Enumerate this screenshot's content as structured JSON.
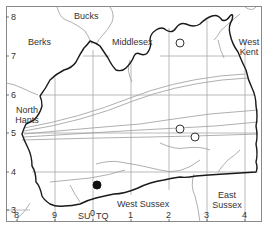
{
  "map": {
    "title": "",
    "colors": {
      "background": "#ffffff",
      "frame": "#8a8a8a",
      "grid": "#a8a8a8",
      "boundary": "#1a1a1a",
      "county_border": "#9a9a9a",
      "text": "#333333",
      "marker_filled": "#111111",
      "marker_open": "#333333"
    },
    "regions": [
      {
        "name": "Bucks",
        "label": "Bucks"
      },
      {
        "name": "Berks",
        "label": "Berks"
      },
      {
        "name": "Middlesex",
        "label": "Middlesex"
      },
      {
        "name": "West Kent",
        "label": "West\nKent"
      },
      {
        "name": "North Hants",
        "label": "North\nHants"
      },
      {
        "name": "West Sussex",
        "label": "West Sussex"
      },
      {
        "name": "East Sussex",
        "label": "East\nSussex"
      }
    ],
    "y_ticks": [
      "8",
      "7",
      "6",
      "5",
      "4",
      "3"
    ],
    "x_ticks": [
      "8",
      "9",
      "0",
      "1",
      "2",
      "3",
      "4"
    ],
    "grid_zone_labels": {
      "left": "SU",
      "right": "TQ"
    },
    "markers": [
      {
        "type": "open-circle",
        "grid_x": 2.35,
        "grid_y": 7.3
      },
      {
        "type": "open-circle",
        "grid_x": 2.4,
        "grid_y": 5.1
      },
      {
        "type": "open-circle",
        "grid_x": 2.75,
        "grid_y": 4.9
      },
      {
        "type": "filled-circle",
        "grid_x": 0.1,
        "grid_y": 3.7
      }
    ]
  }
}
